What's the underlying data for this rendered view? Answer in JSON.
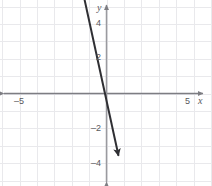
{
  "chart_data": {
    "type": "line",
    "title": "",
    "xlabel": "x",
    "ylabel": "y",
    "xlim": [
      -6,
      6
    ],
    "ylim": [
      -5.3,
      5.3
    ],
    "grid": true,
    "grid_step": 1,
    "legend": "none",
    "x_tick_labels": [
      {
        "value": -5,
        "text": "–5"
      },
      {
        "value": 5,
        "text": "5"
      }
    ],
    "y_tick_labels": [
      {
        "value": 4,
        "text": "4"
      },
      {
        "value": 2,
        "text": "2"
      },
      {
        "value": -2,
        "text": "–2"
      },
      {
        "value": -4,
        "text": "–4"
      }
    ],
    "series": [
      {
        "name": "line",
        "slope": -4.6,
        "intercept": -0.4,
        "x_start": -1.48,
        "y_start": 6.4,
        "x_end": 0.69,
        "y_end": -3.58,
        "arrow_start": true,
        "arrow_end": true
      }
    ],
    "colors": {
      "grid": "#e9e9ec",
      "axis": "#7d7d82",
      "line": "#2f2f33",
      "label": "#58585b",
      "background": "#ffffff"
    }
  }
}
